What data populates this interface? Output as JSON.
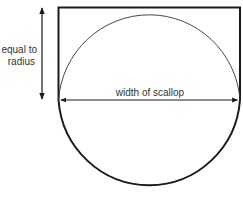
{
  "diagram": {
    "labels": {
      "radius_line1": "equal to",
      "radius_line2": "radius",
      "width": "width of scallop"
    },
    "colors": {
      "stroke": "#1a1a1a",
      "text": "#333333",
      "background": "#ffffff"
    }
  }
}
